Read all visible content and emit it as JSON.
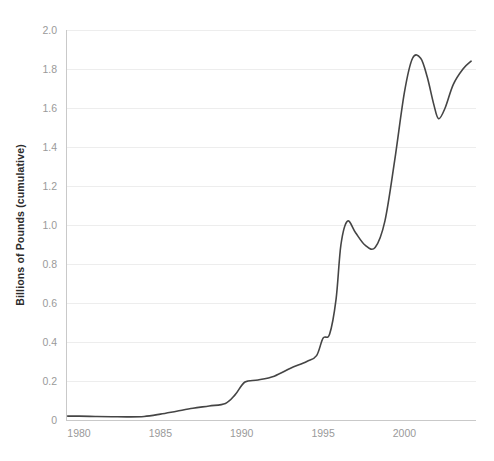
{
  "chart_data": {
    "type": "line",
    "title": "",
    "subtitle": "",
    "xlabel": "",
    "ylabel": "Billions of Pounds (cumulative)",
    "xlim": [
      1979.2,
      2004.4
    ],
    "ylim": [
      0,
      2.0
    ],
    "grid": "horizontal",
    "legend": "none",
    "line_color": "#454545",
    "gridline_color": "#ededed",
    "axis_color": "#c9c9c9",
    "tick_label_color": "#9a9a9a",
    "axis_title_color": "#2b2b2b",
    "x_ticks": [
      {
        "value": 1980,
        "label": "1980"
      },
      {
        "value": 1985,
        "label": "1985"
      },
      {
        "value": 1990,
        "label": "1990"
      },
      {
        "value": 1995,
        "label": "1995"
      },
      {
        "value": 2000,
        "label": "2000"
      }
    ],
    "y_ticks": [
      {
        "value": 0,
        "label": "0"
      },
      {
        "value": 0.2,
        "label": "0.2"
      },
      {
        "value": 0.4,
        "label": "0.4"
      },
      {
        "value": 0.6,
        "label": "0.6"
      },
      {
        "value": 0.8,
        "label": "0.8"
      },
      {
        "value": 1.0,
        "label": "1.0"
      },
      {
        "value": 1.2,
        "label": "1.2"
      },
      {
        "value": 1.4,
        "label": "1.4"
      },
      {
        "value": 1.6,
        "label": "1.6"
      },
      {
        "value": 1.8,
        "label": "1.8"
      },
      {
        "value": 2.0,
        "label": "2.0"
      }
    ],
    "series": [
      {
        "name": "Cumulative total",
        "x": [
          1979.3,
          1980.0,
          1981.0,
          1982.0,
          1983.0,
          1984.0,
          1985.0,
          1986.0,
          1987.0,
          1988.0,
          1989.0,
          1989.6,
          1990.2,
          1991.0,
          1992.0,
          1993.0,
          1994.0,
          1994.6,
          1995.0,
          1995.4,
          1995.8,
          1996.1,
          1996.5,
          1997.0,
          1997.6,
          1998.2,
          1998.8,
          1999.4,
          2000.0,
          2000.5,
          2001.0,
          2001.4,
          2001.8,
          2002.1,
          2002.5,
          2003.0,
          2003.6,
          2004.1
        ],
        "y": [
          0.02,
          0.02,
          0.018,
          0.017,
          0.016,
          0.018,
          0.03,
          0.045,
          0.06,
          0.072,
          0.085,
          0.13,
          0.195,
          0.205,
          0.225,
          0.265,
          0.3,
          0.33,
          0.42,
          0.44,
          0.62,
          0.9,
          1.02,
          0.96,
          0.895,
          0.885,
          1.02,
          1.33,
          1.68,
          1.855,
          1.855,
          1.76,
          1.62,
          1.545,
          1.6,
          1.72,
          1.8,
          1.84
        ]
      }
    ]
  },
  "figure": {
    "background_color": "#ffffff",
    "plot_left_px": 66,
    "plot_right_px": 476,
    "plot_top_px": 30,
    "plot_bottom_px": 420
  }
}
